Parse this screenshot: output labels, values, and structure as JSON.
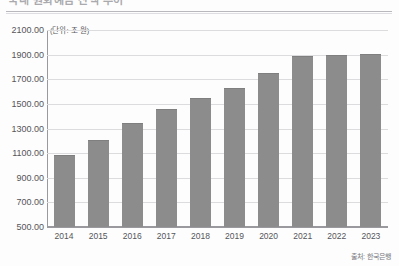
{
  "page": {
    "title_fragment": "국내 원화예금 잔액 추이",
    "source_note": "출처: 한국은행",
    "unit_label": "(단위: 조 원)"
  },
  "colors": {
    "bar": "#8c8c8c",
    "gridline": "#dcdcdf",
    "axis": "#9a9a9e",
    "text": "#55555a",
    "background": "#fdfdfd"
  },
  "chart_data": {
    "type": "bar",
    "title": "국내 원화예금 잔액 추이",
    "xlabel": "",
    "ylabel": "(단위: 조 원)",
    "categories": [
      "2014",
      "2015",
      "2016",
      "2017",
      "2018",
      "2019",
      "2020",
      "2021",
      "2022",
      "2023"
    ],
    "values": [
      1080,
      1200,
      1335,
      1450,
      1540,
      1620,
      1740,
      1880,
      1890,
      1900
    ],
    "value_labels": [
      "1080.00",
      "1200.00",
      "1335.00",
      "1450.00",
      "1540.00",
      "1620.00",
      "1740.00",
      "1880.00",
      "1890.00",
      "1900.00"
    ],
    "ylim": [
      500,
      2100
    ],
    "ytick_step": 200,
    "ytick_labels": [
      "2100.00",
      "1900.00",
      "1700.00",
      "1500.00",
      "1300.00",
      "1100.00",
      "900.00",
      "700.00",
      "500.00"
    ],
    "ytick_values": [
      2100,
      1900,
      1700,
      1500,
      1300,
      1100,
      900,
      700,
      500
    ],
    "grid": true,
    "legend": "none"
  }
}
